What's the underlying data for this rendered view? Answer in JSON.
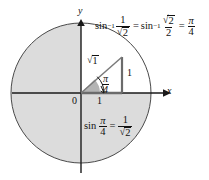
{
  "figure": {
    "background_color": "#ffffff",
    "ink_color": "#1a1a1a",
    "shade_color": "#d9d9d9",
    "axes": {
      "x_label": "x",
      "y_label": "y",
      "origin_label": "0"
    },
    "circle": {
      "center_x": 81,
      "center_y": 93,
      "radius": 70,
      "fill": "#dcdcdc",
      "stroke": "#3a3a3a"
    },
    "triangle": {
      "hypotenuse_label": "√2",
      "vertical_leg_label": "1",
      "horizontal_leg_label": "1",
      "angle_label": "π/4",
      "vertex_x": 122,
      "vertex_y": 57
    },
    "equations": {
      "top": {
        "text": "sin⁻¹ 1/√2  =  sin⁻¹ √2/2  =  π/4",
        "fn": "sin",
        "exponent": "−1",
        "first_numerator": "1",
        "first_denominator_radicand": "2",
        "second_numerator_radicand": "2",
        "second_denominator": "2",
        "result_numerator": "π",
        "result_denominator": "4",
        "equals": "="
      },
      "bottom": {
        "text": "sin π/4  =  1/√2",
        "fn": "sin",
        "angle_numerator": "π",
        "angle_denominator": "4",
        "equals": "=",
        "value_numerator": "1",
        "value_denominator_radicand": "2"
      }
    },
    "glyphs": {
      "radical": "√",
      "pi": "π"
    }
  }
}
